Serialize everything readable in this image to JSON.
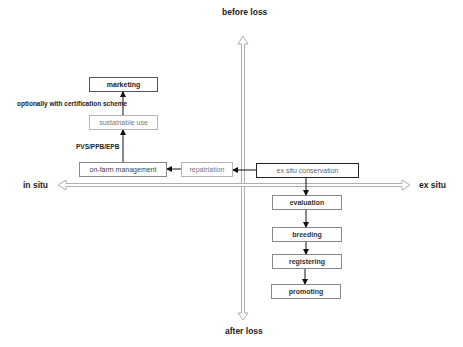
{
  "axes": {
    "top": "before loss",
    "bottom": "after loss",
    "left": "in situ",
    "right": "ex situ"
  },
  "nodes": {
    "marketing": "marketing",
    "sustainable_use": "sustainable use",
    "on_farm": "on-farm management",
    "repatriation": "repatriation",
    "ex_situ": "ex situ conservation",
    "evaluation": "evaluation",
    "breeding": "breeding",
    "registering": "registering",
    "promoting": "promoting"
  },
  "edge_labels": {
    "certification": "optionally with certification scheme",
    "pvs": "PVS/PPB/EPB"
  },
  "edges": [
    {
      "from": "on_farm",
      "to": "sustainable_use",
      "label": "PVS/PPB/EPB"
    },
    {
      "from": "sustainable_use",
      "to": "marketing",
      "label": "optionally with certification scheme"
    },
    {
      "from": "repatriation",
      "to": "on_farm"
    },
    {
      "from": "ex_situ",
      "to": "repatriation"
    },
    {
      "from": "ex_situ",
      "to": "evaluation"
    },
    {
      "from": "evaluation",
      "to": "breeding"
    },
    {
      "from": "breeding",
      "to": "registering"
    },
    {
      "from": "registering",
      "to": "promoting"
    }
  ],
  "colors": {
    "axis": "#9a9a9a",
    "arrow": "#111111",
    "box_border": "#555555",
    "box_border_light": "#b5b5b5"
  }
}
